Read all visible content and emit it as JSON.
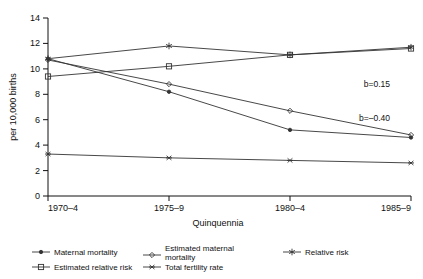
{
  "chart_data": {
    "type": "line",
    "title": "",
    "subtitle": "",
    "xlabel": "Quinquennia",
    "ylabel": "per 10,000 births",
    "categories": [
      "1970–4",
      "1975–9",
      "1980–4",
      "1985–9"
    ],
    "x_tick_labels": [
      "1970–4",
      "1975–9",
      "1980–4",
      "1985–9"
    ],
    "y_tick_labels": [
      "0",
      "2",
      "4",
      "6",
      "8",
      "10",
      "12",
      "14"
    ],
    "y_ticks": [
      0,
      2,
      4,
      6,
      8,
      10,
      12,
      14
    ],
    "ylim": [
      0,
      14
    ],
    "grid": false,
    "legend_position": "bottom",
    "series": [
      {
        "name": "Maternal mortality",
        "marker": "filled-circle",
        "values": [
          10.8,
          8.2,
          5.2,
          4.6
        ]
      },
      {
        "name": "Estimated maternal mortality",
        "marker": "open-diamond",
        "values": [
          10.7,
          8.8,
          6.7,
          4.8
        ]
      },
      {
        "name": "Relative risk",
        "marker": "asterisk",
        "values": [
          10.8,
          11.8,
          11.1,
          11.7
        ]
      },
      {
        "name": "Estimated relative risk",
        "marker": "open-square",
        "values": [
          9.4,
          10.2,
          11.1,
          11.6
        ]
      },
      {
        "name": "Total fertility rate",
        "marker": "star",
        "values": [
          3.3,
          3.0,
          2.8,
          2.6
        ]
      }
    ],
    "annotations": [
      {
        "text": "b=0.15",
        "x_category": "1985–9",
        "y": 8.6
      },
      {
        "text": "b=–0.40",
        "x_category": "1985–9",
        "y": 5.9
      }
    ]
  },
  "legend": {
    "items": [
      {
        "label": "Maternal mortality",
        "marker": "filled-circle"
      },
      {
        "label": "Estimated maternal mortality",
        "marker": "open-diamond"
      },
      {
        "label": "Relative risk",
        "marker": "asterisk"
      },
      {
        "label": "Estimated relative risk",
        "marker": "open-square"
      },
      {
        "label": "Total fertility rate",
        "marker": "star"
      }
    ]
  }
}
